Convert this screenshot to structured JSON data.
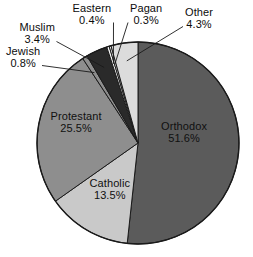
{
  "chart_data": {
    "type": "pie",
    "title": "",
    "subtitle": "",
    "xlabel": "",
    "ylabel": "",
    "legend_position": "none",
    "grid": false,
    "labels_show_percent": true,
    "start_angle_deg": 0,
    "direction": "clockwise",
    "categories": [
      "Orthodox",
      "Other",
      "Pagan",
      "Eastern",
      "Muslim",
      "Jewish",
      "Protestant",
      "Catholic"
    ],
    "values": [
      51.6,
      4.3,
      0.3,
      0.4,
      3.4,
      0.8,
      25.5,
      13.5
    ],
    "units": "percent",
    "slices": [
      {
        "name": "Orthodox",
        "value": 51.6,
        "value_text": "51.6%",
        "color": "#5b5b5b",
        "label_placement": "inside",
        "label_x": 184,
        "label_y": 132,
        "leader": false
      },
      {
        "name": "Catholic",
        "value": 13.5,
        "value_text": "13.5%",
        "color": "#c9c9c9",
        "label_placement": "inside",
        "label_x": 110,
        "label_y": 189,
        "leader": false
      },
      {
        "name": "Protestant",
        "value": 25.5,
        "value_text": "25.5%",
        "color": "#8e8e8e",
        "label_placement": "inside",
        "label_x": 76,
        "label_y": 122,
        "leader": false
      },
      {
        "name": "Jewish",
        "value": 0.8,
        "value_text": "0.8%",
        "color": "#8e8e8e",
        "label_placement": "outside",
        "label_x": 23,
        "label_y": 57,
        "leader": true
      },
      {
        "name": "Muslim",
        "value": 3.4,
        "value_text": "3.4%",
        "color": "#2a2a2a",
        "label_placement": "outside",
        "label_x": 37,
        "label_y": 33,
        "leader": true
      },
      {
        "name": "Eastern",
        "value": 0.4,
        "value_text": "0.4%",
        "color": "#f2f2f2",
        "label_placement": "outside",
        "label_x": 92,
        "label_y": 14,
        "leader": true
      },
      {
        "name": "Pagan",
        "value": 0.3,
        "value_text": "0.3%",
        "color": "#f2f2f2",
        "label_placement": "outside",
        "label_x": 146,
        "label_y": 14,
        "leader": true
      },
      {
        "name": "Other",
        "value": 4.3,
        "value_text": "4.3%",
        "color": "#dcdcdc",
        "label_placement": "outside",
        "label_x": 199,
        "label_y": 18,
        "leader": true
      }
    ],
    "geometry": {
      "center_x": 138,
      "center_y": 143,
      "radius": 101
    },
    "colors": {
      "background": "#ffffff",
      "outline": "#1a1a1a",
      "text": "#111111"
    }
  }
}
